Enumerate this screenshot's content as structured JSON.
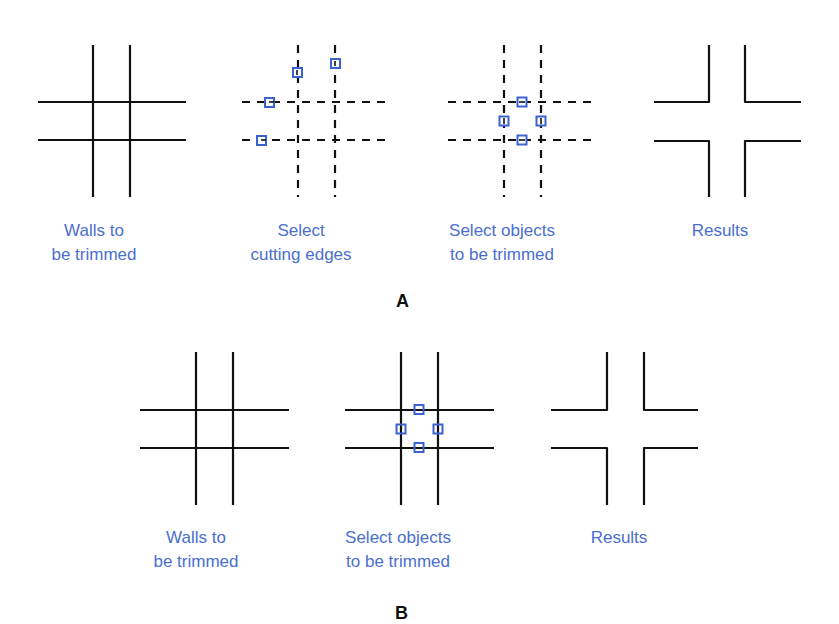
{
  "colors": {
    "line": "#111111",
    "pick_box": "#3a62d0",
    "label": "#4a6fcf"
  },
  "panel_A": {
    "letter": "A",
    "steps": [
      {
        "id": "walls",
        "label_lines": [
          "Walls to",
          "be trimmed"
        ]
      },
      {
        "id": "cutting-edges",
        "label_lines": [
          "Select",
          "cutting edges"
        ]
      },
      {
        "id": "objects",
        "label_lines": [
          "Select objects",
          "to be trimmed"
        ]
      },
      {
        "id": "results",
        "label_lines": [
          "Results"
        ]
      }
    ]
  },
  "panel_B": {
    "letter": "B",
    "steps": [
      {
        "id": "walls",
        "label_lines": [
          "Walls to",
          "be trimmed"
        ]
      },
      {
        "id": "objects",
        "label_lines": [
          "Select objects",
          "to be trimmed"
        ]
      },
      {
        "id": "results",
        "label_lines": [
          "Results"
        ]
      }
    ]
  }
}
